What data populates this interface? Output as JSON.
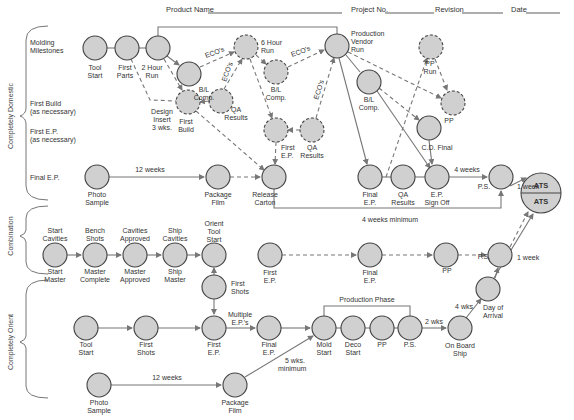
{
  "header": {
    "product_name_label": "Product Name",
    "project_no_label": "Project No.",
    "revision_label": "Revision",
    "date_label": "Date"
  },
  "sections": {
    "domestic": "Completely Domestic",
    "combination": "Combination",
    "orient": "Completely Orient"
  },
  "row_labels": {
    "molding_1": "Molding",
    "molding_2": "Milestones",
    "first_build_1": "First Build",
    "first_build_2": "(as necessary)",
    "first_ep_1": "First E.P.",
    "first_ep_2": "(as necessary)",
    "final_ep": "Final E.P."
  },
  "nodes": {
    "tool_start": [
      "Tool",
      "Start"
    ],
    "first_parts": [
      "First",
      "Parts"
    ],
    "two_hour_run": [
      "2 Hour",
      "Run"
    ],
    "bl_comp_1": [
      "B/L",
      "Comp."
    ],
    "first_build": [
      "First",
      "Build"
    ],
    "design_insert": [
      "Design",
      "Insert",
      "3 wks."
    ],
    "qa_results_1": [
      "QA",
      "Results"
    ],
    "six_hour_run": [
      "6 Hour",
      "Run"
    ],
    "bl_comp_2": [
      "B/L",
      "Comp."
    ],
    "first_ep_dashed": [
      "First",
      "E.P."
    ],
    "qa_results_2": [
      "QA",
      "Results"
    ],
    "production_vendor_run": [
      "Production",
      "Vendor",
      "Run"
    ],
    "bl_comp_3": [
      "B/L",
      "Comp."
    ],
    "pp_run": [
      "PP",
      "Run"
    ],
    "pp_dashed": "PP",
    "cd_final": "C.D. Final",
    "photo_sample_1": [
      "Photo",
      "Sample"
    ],
    "package_film_1": [
      "Package",
      "Film"
    ],
    "release_carton": [
      "Release",
      "Carton"
    ],
    "final_ep_1": [
      "Final",
      "E.P."
    ],
    "qa_results_3": [
      "QA",
      "Results"
    ],
    "ep_sign_off": [
      "E.P.",
      "Sign Off"
    ],
    "ps_1": "P.S.",
    "ats_top": "ATS",
    "ats_bottom": "ATS",
    "start_cavities": [
      "Start",
      "Cavities"
    ],
    "start_master": [
      "Start",
      "Master"
    ],
    "bench_shots": [
      "Bench",
      "Shots"
    ],
    "master_complete": [
      "Master",
      "Complete"
    ],
    "cavities_approved": [
      "Cavities",
      "Approved"
    ],
    "master_approved": [
      "Master",
      "Approved"
    ],
    "ship_cavities": [
      "Ship",
      "Cavities"
    ],
    "ship_master": [
      "Ship",
      "Master"
    ],
    "orient_tool_start": [
      "Orient",
      "Tool",
      "Start"
    ],
    "first_shots_comb": [
      "First",
      "Shots"
    ],
    "first_ep_comb": [
      "First",
      "E.P."
    ],
    "final_ep_comb": [
      "Final",
      "E.P."
    ],
    "pp_comb": "PP",
    "ps_2": "P.S.",
    "day_of_arrival": [
      "Day of",
      "Arrival"
    ],
    "tool_start_orient": [
      "Tool",
      "Start"
    ],
    "first_shots_orient": [
      "First",
      "Shots"
    ],
    "first_ep_orient": [
      "First",
      "E.P."
    ],
    "multiple_eps": [
      "Multiple",
      "E.P.'s"
    ],
    "final_ep_orient": [
      "Final",
      "E.P."
    ],
    "mold_start": [
      "Mold",
      "Start"
    ],
    "deco_start": [
      "Deco",
      "Start"
    ],
    "pp_orient": "PP",
    "ps_orient": "P.S.",
    "on_board_ship": [
      "On Board",
      "Ship"
    ],
    "photo_sample_2": [
      "Photo",
      "Sample"
    ],
    "package_film_2": [
      "Package",
      "Film"
    ]
  },
  "edge_labels": {
    "ecos_1": "ECO's",
    "ecos_2": "ECO's",
    "ecos_3": "ECO's",
    "ecos_4": "ECO's",
    "twelve_weeks_1": "12 weeks",
    "four_weeks": "4 weeks",
    "one_week_1": "1 week",
    "four_weeks_minimum": "4 weeks minimum",
    "one_week_2": "1 week",
    "production_phase": "Production Phase",
    "two_wks": "2 wks",
    "four_wks": "4 wks",
    "five_wks_minimum": [
      "5 wks.",
      "minimum"
    ],
    "twelve_weeks_2": "12 weeks"
  }
}
